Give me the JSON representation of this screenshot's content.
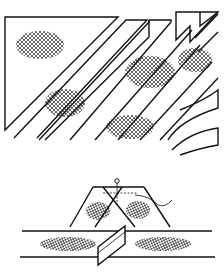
{
  "figure": {
    "title": "",
    "top_panel": {
      "label": "bias-strips-cutting-diagram"
    },
    "bottom_panel": {
      "label": "strip-joining-diagram"
    }
  },
  "colors": {
    "ink": "#111111",
    "paper": "#ffffff"
  }
}
